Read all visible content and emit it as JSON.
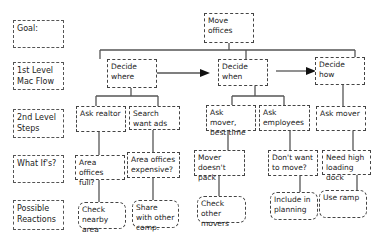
{
  "row_labels": [
    "Goal:",
    "1st Level Mac Flow",
    "2nd Level Steps",
    "What If's?",
    "Possible Reactions"
  ],
  "goal": "Move offices",
  "level1": [
    "Decide where",
    "Decide when",
    "Decide how"
  ],
  "level2": [
    "Ask realtor",
    "Search want ads",
    "Ask mover, best time",
    "Ask employees",
    "Ask mover"
  ],
  "what_ifs": [
    "Area offices full?",
    "Area offices expensive?",
    "Mover doesn't pack",
    "Don't want to move?",
    "Need high loading dock"
  ],
  "reactions": [
    "Check nearby area",
    "Share with other comp.",
    "Check other movers",
    "Include in planning",
    "Use ramp"
  ]
}
